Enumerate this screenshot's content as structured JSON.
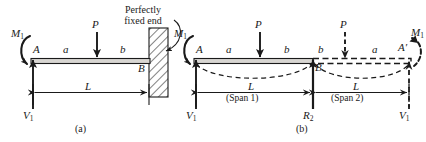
{
  "figure": {
    "ink_color": "#1a1a1a",
    "beam_fill": "#d8d6d2",
    "hatch_color": "#1a1a1a",
    "background": "#ffffff"
  },
  "panel_a": {
    "caption": "(a)",
    "moment_label": "M",
    "moment_sub": "1",
    "reaction_label": "V",
    "reaction_sub": "1",
    "node_left": "A",
    "node_right": "B",
    "seg_left": "a",
    "seg_right": "b",
    "load_label": "P",
    "span_label": "L",
    "note_line1": "Perfectly",
    "note_line2": "fixed end",
    "icons": [
      "moment-arc-arrow",
      "point-load-arrow",
      "reaction-arrow",
      "fixed-end-hatch",
      "dimension-arrow"
    ]
  },
  "panel_b": {
    "caption": "(b)",
    "moment_left_label": "M",
    "moment_left_sub": "1",
    "moment_right_label": "M",
    "moment_right_sub": "1",
    "reaction_left_label": "V",
    "reaction_left_sub": "1",
    "reaction_right_label": "V",
    "reaction_right_sub": "1",
    "center_reaction_label": "R",
    "center_reaction_sub": "2",
    "node_left": "A",
    "node_center": "B",
    "node_right": "A′",
    "span1_seg_left": "a",
    "span1_seg_right": "b",
    "span2_seg_left": "b",
    "span2_seg_right": "a",
    "load_left_label": "P",
    "load_right_label": "P",
    "span1_length": "L",
    "span1_name": "(Span 1)",
    "span2_length": "L",
    "span2_name": "(Span 2)",
    "icons": [
      "moment-arc-arrow",
      "moment-arc-arrow-dashed",
      "point-load-arrow",
      "point-load-arrow-dashed",
      "reaction-arrow",
      "reaction-arrow-dashed",
      "deflection-curve-dashed",
      "dimension-arrow"
    ]
  }
}
